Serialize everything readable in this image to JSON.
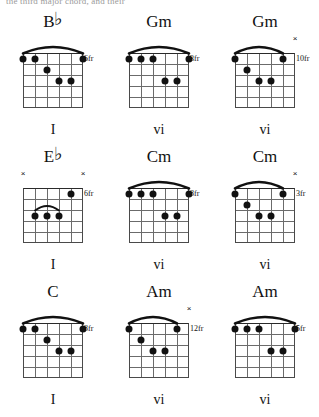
{
  "caption": "the third major chord, and their",
  "diagram_geometry": {
    "strings": 6,
    "frets": 5,
    "string_order": "low-E-to-high-E-left-to-right"
  },
  "rows": [
    {
      "chords": [
        {
          "name": "B",
          "accidental": "♭",
          "suffix": "",
          "position_label": "6fr",
          "numeral": "I",
          "mutes": [],
          "barre": {
            "from_string": 1,
            "to_string": 6,
            "fret": 1
          },
          "dots": [
            {
              "string": 1,
              "fret": 1
            },
            {
              "string": 5,
              "fret": 1
            },
            {
              "string": 6,
              "fret": 1
            },
            {
              "string": 4,
              "fret": 2
            },
            {
              "string": 2,
              "fret": 3
            },
            {
              "string": 3,
              "fret": 3
            }
          ]
        },
        {
          "name": "Gm",
          "accidental": "",
          "suffix": "",
          "position_label": "3fr",
          "numeral": "vi",
          "mutes": [],
          "barre": {
            "from_string": 1,
            "to_string": 6,
            "fret": 1
          },
          "dots": [
            {
              "string": 1,
              "fret": 1
            },
            {
              "string": 4,
              "fret": 1
            },
            {
              "string": 5,
              "fret": 1
            },
            {
              "string": 6,
              "fret": 1
            },
            {
              "string": 2,
              "fret": 3
            },
            {
              "string": 3,
              "fret": 3
            }
          ]
        },
        {
          "name": "Gm",
          "accidental": "",
          "suffix": "",
          "position_label": "10fr",
          "numeral": "vi",
          "mutes": [
            1
          ],
          "barre": {
            "from_string": 2,
            "to_string": 6,
            "fret": 1
          },
          "dots": [
            {
              "string": 2,
              "fret": 1
            },
            {
              "string": 6,
              "fret": 1
            },
            {
              "string": 5,
              "fret": 2
            },
            {
              "string": 3,
              "fret": 3
            },
            {
              "string": 4,
              "fret": 3
            }
          ]
        }
      ]
    },
    {
      "chords": [
        {
          "name": "E",
          "accidental": "♭",
          "suffix": "",
          "position_label": "6fr",
          "numeral": "I",
          "mutes": [
            1,
            6
          ],
          "barre": null,
          "mini_barre": {
            "from_string": 3,
            "to_string": 5,
            "fret": 3
          },
          "dots": [
            {
              "string": 2,
              "fret": 1
            },
            {
              "string": 3,
              "fret": 3
            },
            {
              "string": 4,
              "fret": 3
            },
            {
              "string": 5,
              "fret": 3
            }
          ]
        },
        {
          "name": "Cm",
          "accidental": "",
          "suffix": "",
          "position_label": "8fr",
          "numeral": "vi",
          "mutes": [],
          "barre": {
            "from_string": 1,
            "to_string": 6,
            "fret": 1
          },
          "dots": [
            {
              "string": 1,
              "fret": 1
            },
            {
              "string": 4,
              "fret": 1
            },
            {
              "string": 5,
              "fret": 1
            },
            {
              "string": 6,
              "fret": 1
            },
            {
              "string": 2,
              "fret": 3
            },
            {
              "string": 3,
              "fret": 3
            }
          ]
        },
        {
          "name": "Cm",
          "accidental": "",
          "suffix": "",
          "position_label": "3fr",
          "numeral": "vi",
          "mutes": [
            1
          ],
          "barre": {
            "from_string": 2,
            "to_string": 6,
            "fret": 1
          },
          "dots": [
            {
              "string": 2,
              "fret": 1
            },
            {
              "string": 6,
              "fret": 1
            },
            {
              "string": 5,
              "fret": 2
            },
            {
              "string": 3,
              "fret": 3
            },
            {
              "string": 4,
              "fret": 3
            }
          ]
        }
      ]
    },
    {
      "chords": [
        {
          "name": "C",
          "accidental": "",
          "suffix": "",
          "position_label": "8fr",
          "numeral": "I",
          "mutes": [],
          "barre": {
            "from_string": 1,
            "to_string": 6,
            "fret": 1
          },
          "dots": [
            {
              "string": 1,
              "fret": 1
            },
            {
              "string": 5,
              "fret": 1
            },
            {
              "string": 6,
              "fret": 1
            },
            {
              "string": 4,
              "fret": 2
            },
            {
              "string": 2,
              "fret": 3
            },
            {
              "string": 3,
              "fret": 3
            }
          ]
        },
        {
          "name": "Am",
          "accidental": "",
          "suffix": "",
          "position_label": "12fr",
          "numeral": "vi",
          "mutes": [
            1
          ],
          "barre": {
            "from_string": 2,
            "to_string": 6,
            "fret": 1
          },
          "dots": [
            {
              "string": 2,
              "fret": 1
            },
            {
              "string": 6,
              "fret": 1
            },
            {
              "string": 5,
              "fret": 2
            },
            {
              "string": 3,
              "fret": 3
            },
            {
              "string": 4,
              "fret": 3
            }
          ]
        },
        {
          "name": "Am",
          "accidental": "",
          "suffix": "",
          "position_label": "5fr",
          "numeral": "vi",
          "mutes": [],
          "barre": {
            "from_string": 1,
            "to_string": 6,
            "fret": 1
          },
          "dots": [
            {
              "string": 1,
              "fret": 1
            },
            {
              "string": 4,
              "fret": 1
            },
            {
              "string": 5,
              "fret": 1
            },
            {
              "string": 6,
              "fret": 1
            },
            {
              "string": 2,
              "fret": 3
            },
            {
              "string": 3,
              "fret": 3
            }
          ]
        }
      ]
    }
  ]
}
